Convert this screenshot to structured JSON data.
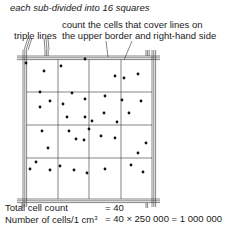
{
  "caption": "each sub-divided into 16 squares",
  "annotations": {
    "count_rule_line1": "count the cells that cover lines on",
    "count_rule_line2": "the upper border and right-hand side",
    "triple_lines": "triple lines"
  },
  "grid": {
    "large_squares": 16,
    "rows": 4,
    "cols": 4,
    "line_color": "#333333",
    "dot_color": "#111111"
  },
  "cells": [
    [
      26,
      63
    ],
    [
      44,
      71
    ],
    [
      61,
      66
    ],
    [
      85,
      59
    ],
    [
      124,
      78
    ],
    [
      115,
      76
    ],
    [
      138,
      74
    ],
    [
      40,
      92
    ],
    [
      72,
      93
    ],
    [
      50,
      101
    ],
    [
      63,
      104
    ],
    [
      85,
      99
    ],
    [
      105,
      96
    ],
    [
      122,
      100
    ],
    [
      141,
      101
    ],
    [
      40,
      107
    ],
    [
      67,
      117
    ],
    [
      85,
      117
    ],
    [
      104,
      113
    ],
    [
      117,
      122
    ],
    [
      129,
      113
    ],
    [
      84,
      140
    ],
    [
      92,
      121
    ],
    [
      42,
      131
    ],
    [
      48,
      148
    ],
    [
      69,
      131
    ],
    [
      76,
      139
    ],
    [
      89,
      129
    ],
    [
      101,
      136
    ],
    [
      115,
      138
    ],
    [
      146,
      143
    ],
    [
      138,
      153
    ],
    [
      36,
      162
    ],
    [
      30,
      169
    ],
    [
      50,
      170
    ],
    [
      60,
      166
    ],
    [
      74,
      170
    ],
    [
      87,
      173
    ],
    [
      105,
      169
    ],
    [
      131,
      165
    ],
    [
      143,
      172
    ]
  ],
  "results": {
    "total_label": "Total cell count",
    "total_value": "= 40",
    "per_cm3_label": "Number of cells/1 cm",
    "per_cm3_exp": "3",
    "per_cm3_value": "= 40 × 250 000 = 1 000 000"
  }
}
